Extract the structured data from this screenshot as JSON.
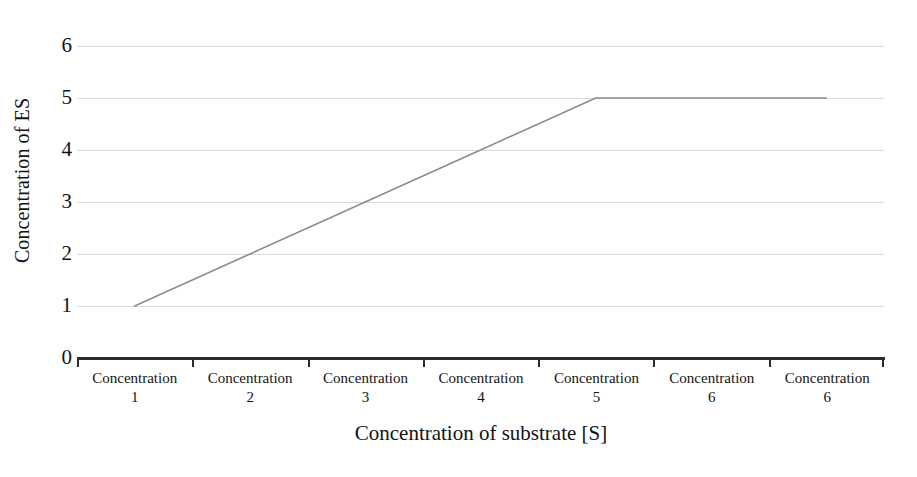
{
  "chart_data": {
    "type": "line",
    "title": "",
    "xlabel": "Concentration of substrate [S]",
    "ylabel": "Concentration of ES",
    "categories": [
      "Concentration 1",
      "Concentration 2",
      "Concentration 3",
      "Concentration 4",
      "Concentration 5",
      "Concentration 6",
      "Concentration 6"
    ],
    "category_names": [
      "Concentration",
      "Concentration",
      "Concentration",
      "Concentration",
      "Concentration",
      "Concentration",
      "Concentration"
    ],
    "category_numbers": [
      "1",
      "2",
      "3",
      "4",
      "5",
      "6",
      "6"
    ],
    "series": [
      {
        "name": "Concentration of ES",
        "values": [
          1,
          2,
          3,
          4,
          5,
          5,
          5
        ],
        "color": "#8c8c8c"
      }
    ],
    "ylim": [
      0,
      6
    ],
    "y_ticks": [
      "0",
      "1",
      "2",
      "3",
      "4",
      "5",
      "6"
    ],
    "gridline_values": [
      1,
      2,
      3,
      4,
      5,
      6
    ],
    "grid": true,
    "grid_color": "#d9d9d9",
    "axis_color": "#2b2b2b",
    "legend": "none",
    "legend_position": "none"
  },
  "axes": {
    "y_title": "Concentration of ES",
    "x_title": "Concentration of substrate [S]"
  }
}
